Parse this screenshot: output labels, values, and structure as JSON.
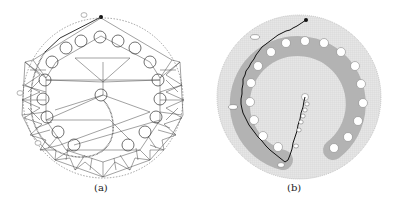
{
  "figure": {
    "panels": [
      {
        "id": "a",
        "caption": "(a)",
        "description": "Triangulated mesh around circular obstacles with dotted planned path from start marker down the left side and back up to the center circle",
        "waypoint_labels": [
          "label near start (unreadable)",
          "left label (unreadable)",
          "lower-left label (unreadable)",
          "center marker"
        ],
        "center_label": "",
        "obstacle_count": 17
      },
      {
        "id": "b",
        "caption": "(b)",
        "description": "Grid occupancy map with gray inflated obstacle ring, white circular obstacles, and black stepped path from start dot around left side to the center",
        "waypoint_labels": [
          "upper-left label (unreadable)",
          "left label (unreadable)",
          "bottom label (unreadable)",
          "center-path labels (unreadable)"
        ],
        "center_label": "",
        "obstacle_count": 19
      }
    ],
    "colors": {
      "line": "#333333",
      "path_dotted": "#555555",
      "ring_gray": "#b5b5b5",
      "grid_light": "#dcdcdc",
      "path_black": "#111111",
      "background": "#ffffff"
    }
  }
}
